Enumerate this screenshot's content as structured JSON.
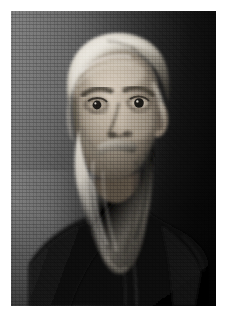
{
  "page": {
    "width": 226,
    "height": 322,
    "background_color": "#ffffff",
    "type": "photograph"
  },
  "photo": {
    "name": "vintage-portrait-photograph",
    "subject_description": "Elderly bearded man in dark robe, three-quarter portrait",
    "medium": "monochrome halftone print",
    "left": 11,
    "top": 11,
    "width": 205,
    "height": 295,
    "palette": {
      "backdrop_light": "#7a7a7a",
      "backdrop_mid": "#4a4a4a",
      "backdrop_dark": "#060606",
      "skin_light": "#cfc4b6",
      "skin_mid": "#9a8e80",
      "skin_shadow": "#4e463d",
      "hair_light": "#efece5",
      "hair_mid": "#b9b3a8",
      "beard_light": "#dcd8d0",
      "beard_mid": "#9b958b",
      "beard_dark": "#4a463f",
      "garment_dark": "#0d0d0d",
      "garment_mid": "#1d1d1d",
      "eye_dark": "#121212"
    }
  },
  "caption": {
    "text": ""
  }
}
